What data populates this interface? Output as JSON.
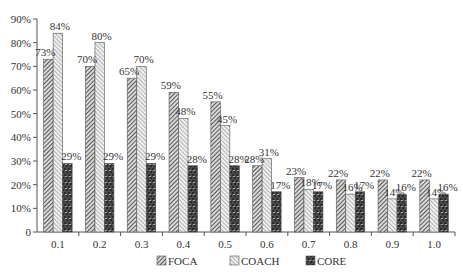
{
  "chart_data": {
    "type": "bar",
    "title": "",
    "xlabel": "",
    "ylabel": "",
    "ylim": [
      0,
      90
    ],
    "yticks": [
      "0",
      "10%",
      "20%",
      "30%",
      "40%",
      "50%",
      "60%",
      "70%",
      "80%",
      "90%"
    ],
    "categories": [
      "0.1",
      "0.2",
      "0.3",
      "0.4",
      "0.5",
      "0.6",
      "0.7",
      "0.8",
      "0.9",
      "1.0"
    ],
    "series": [
      {
        "name": "FOCA",
        "pattern": "dense-diagonal-hatch",
        "values": [
          73,
          70,
          65,
          59,
          55,
          28,
          23,
          22,
          22,
          22
        ]
      },
      {
        "name": "COACH",
        "pattern": "light-diagonal-hatch",
        "values": [
          84,
          80,
          70,
          48,
          45,
          31,
          18,
          16,
          14,
          14
        ]
      },
      {
        "name": "CORE",
        "pattern": "dark-dotted-grid",
        "values": [
          29,
          29,
          29,
          28,
          28,
          17,
          17,
          17,
          16,
          16
        ]
      }
    ],
    "grid": false,
    "legend_position": "bottom"
  },
  "legend": {
    "items": [
      {
        "label": "FOCA"
      },
      {
        "label": "COACH"
      },
      {
        "label": "CORE"
      }
    ]
  },
  "colors": {
    "axis": "#555555",
    "foca": "#444444",
    "coach": "#888888",
    "core": "#333333"
  }
}
